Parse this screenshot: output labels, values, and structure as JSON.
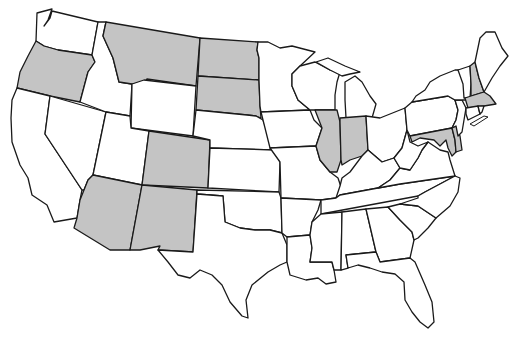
{
  "map": {
    "title": "United States map with highlighted states",
    "colors": {
      "shaded": "#c4c4c4",
      "unshaded": "#ffffff",
      "border": "#1a1a1a"
    },
    "shaded_states": [
      "Oregon",
      "Montana",
      "North Dakota",
      "South Dakota",
      "Colorado",
      "Arizona",
      "New Mexico",
      "Illinois",
      "Indiana",
      "New Hampshire",
      "Massachusetts",
      "Maryland",
      "Delaware"
    ],
    "states": [
      {
        "id": "WA",
        "name": "Washington",
        "shaded": false,
        "path": "M37,13 L52,9 L48,20 L44,26 L50,18 L52,11 L98,22 L92,55 L58,50 L44,46 L36,41 Z"
      },
      {
        "id": "OR",
        "name": "Oregon",
        "shaded": true,
        "path": "M36,41 L44,46 L58,50 L92,55 L95,62 L88,72 L80,102 L50,96 L17,88 L20,72 L28,56 Z"
      },
      {
        "id": "CA",
        "name": "California",
        "shaded": false,
        "path": "M17,88 L50,96 L45,134 L82,190 L80,200 L77,218 L54,222 L47,205 L32,195 L28,178 L20,165 L12,142 L11,118 L12,100 Z"
      },
      {
        "id": "NV",
        "name": "Nevada",
        "shaded": false,
        "path": "M50,96 L106,112 L93,175 L88,180 L84,190 L82,190 L45,134 Z"
      },
      {
        "id": "ID",
        "name": "Idaho",
        "shaded": false,
        "path": "M98,22 L106,22 L103,36 L113,58 L119,82 L132,84 L130,116 L106,112 L80,102 L88,72 L95,62 L92,55 Z"
      },
      {
        "id": "MT",
        "name": "Montana",
        "shaded": true,
        "path": "M106,22 L200,38 L196,86 L147,79 L144,83 L132,84 L119,82 L113,58 L103,36 Z"
      },
      {
        "id": "WY",
        "name": "Wyoming",
        "shaded": false,
        "path": "M144,80 L196,86 L193,136 L131,128 L132,84 Z"
      },
      {
        "id": "UT",
        "name": "Utah",
        "shaded": false,
        "path": "M106,112 L130,116 L131,128 L149,131 L142,185 L93,175 Z"
      },
      {
        "id": "AZ",
        "name": "Arizona",
        "shaded": true,
        "path": "M93,175 L142,185 L130,250 L110,250 L74,228 L77,218 L80,200 L84,190 L88,180 Z"
      },
      {
        "id": "CO",
        "name": "Colorado",
        "shaded": true,
        "path": "M149,131 L210,140 L208,188 L142,185 Z"
      },
      {
        "id": "NM",
        "name": "New Mexico",
        "shaded": true,
        "path": "M142,185 L197,190 L193,252 L158,250 L160,246 L140,250 L130,250 Z"
      },
      {
        "id": "ND",
        "name": "North Dakota",
        "shaded": true,
        "path": "M200,38 L258,42 L257,50 L259,58 L259,80 L198,76 Z"
      },
      {
        "id": "SD",
        "name": "South Dakota",
        "shaded": true,
        "path": "M198,76 L259,80 L260,106 L261,118 L256,116 L247,115 L196,110 Z"
      },
      {
        "id": "NE",
        "name": "Nebraska",
        "shaded": false,
        "path": "M196,110 L247,115 L256,116 L263,120 L274,150 L210,148 L210,140 L193,136 Z"
      },
      {
        "id": "KS",
        "name": "Kansas",
        "shaded": false,
        "path": "M210,148 L274,150 L280,162 L279,192 L208,188 Z"
      },
      {
        "id": "OK",
        "name": "Oklahoma",
        "shaded": false,
        "path": "M197,190 L279,192 L281,198 L282,233 L270,230 L255,230 L240,228 L225,222 L223,196 L197,194 Z"
      },
      {
        "id": "TX",
        "name": "Texas",
        "shaded": false,
        "path": "M197,194 L223,196 L225,222 L240,228 L255,230 L270,230 L282,233 L287,245 L287,262 L280,265 L268,272 L252,285 L246,300 L248,318 L242,316 L230,302 L222,285 L212,275 L200,270 L190,278 L178,275 L168,262 L158,250 L193,252 Z"
      },
      {
        "id": "MN",
        "name": "Minnesota",
        "shaded": false,
        "path": "M258,42 L268,42 L280,48 L292,46 L315,52 L300,66 L292,74 L292,86 L298,100 L310,110 L261,112 L260,106 L259,80 L259,58 L257,50 Z"
      },
      {
        "id": "IA",
        "name": "Iowa",
        "shaded": false,
        "path": "M261,112 L310,110 L314,120 L322,128 L318,140 L316,146 L270,148 L263,120 Z"
      },
      {
        "id": "MO",
        "name": "Missouri",
        "shaded": false,
        "path": "M270,148 L316,146 L320,160 L330,172 L338,178 L342,190 L336,198 L321,200 L281,198 L280,162 Z"
      },
      {
        "id": "AR",
        "name": "Arkansas",
        "shaded": false,
        "path": "M281,198 L321,200 L318,210 L312,222 L310,235 L287,237 L282,233 Z"
      },
      {
        "id": "LA",
        "name": "Louisiana",
        "shaded": false,
        "path": "M287,237 L310,235 L312,248 L310,262 L332,262 L334,270 L336,282 L326,284 L318,278 L306,280 L290,275 L287,262 Z"
      },
      {
        "id": "WI",
        "name": "Wisconsin",
        "shaded": false,
        "path": "M292,74 L300,66 L315,62 L330,70 L340,72 L337,82 L335,95 L335,110 L315,110 L310,110 L298,100 L292,86 Z"
      },
      {
        "id": "IL",
        "name": "Illinois",
        "shaded": true,
        "path": "M315,110 L337,110 L340,122 L341,160 L337,172 L330,172 L320,160 L316,146 L318,140 L322,128 Z"
      },
      {
        "id": "MI",
        "name": "Michigan",
        "shaded": false,
        "path": "M316,62 L328,58 L345,66 L360,72 L350,74 L342,76 L330,70 Z M345,82 L355,76 L362,82 L370,96 L376,104 L372,118 L360,118 L346,118 L345,100 Z"
      },
      {
        "id": "IN",
        "name": "Indiana",
        "shaded": true,
        "path": "M340,118 L366,116 L368,150 L362,156 L350,160 L342,165 L341,160 L340,122 Z"
      },
      {
        "id": "OH",
        "name": "Ohio",
        "shaded": false,
        "path": "M366,116 L380,118 L395,112 L405,108 L407,130 L402,148 L394,158 L382,162 L368,150 Z"
      },
      {
        "id": "KY",
        "name": "Kentucky",
        "shaded": false,
        "path": "M336,198 L340,186 L342,178 L350,172 L362,156 L368,150 L382,162 L394,158 L400,168 L390,180 L378,188 L340,195 Z"
      },
      {
        "id": "TN",
        "name": "Tennessee",
        "shaded": false,
        "path": "M336,198 L340,195 L378,188 L400,184 L455,176 L440,184 L425,192 L418,196 L321,214 L321,200 Z"
      },
      {
        "id": "MS",
        "name": "Mississippi",
        "shaded": false,
        "path": "M321,214 L342,212 L341,270 L334,270 L332,262 L310,262 L312,248 L310,235 L312,222 Z"
      },
      {
        "id": "AL",
        "name": "Alabama",
        "shaded": false,
        "path": "M342,212 L366,209 L376,252 L346,255 L348,268 L341,270 Z"
      },
      {
        "id": "GA",
        "name": "Georgia",
        "shaded": false,
        "path": "M366,209 L388,207 L400,220 L412,232 L414,240 L410,258 L380,262 L376,252 Z"
      },
      {
        "id": "FL",
        "name": "Florida",
        "shaded": false,
        "path": "M346,255 L376,252 L380,262 L410,258 L415,262 L425,285 L432,302 L434,322 L428,328 L420,322 L412,312 L405,300 L404,282 L395,274 L382,272 L370,268 L358,265 L348,268 Z"
      },
      {
        "id": "SC",
        "name": "South Carolina",
        "shaded": false,
        "path": "M388,207 L400,204 L418,206 L436,218 L428,228 L418,238 L414,240 L412,232 L400,220 Z"
      },
      {
        "id": "NC",
        "name": "North Carolina",
        "shaded": false,
        "path": "M418,196 L425,192 L440,184 L455,176 L460,178 L458,192 L450,206 L436,218 L418,206 L400,204 L418,198 Z"
      },
      {
        "id": "VA",
        "name": "Virginia",
        "shaded": false,
        "path": "M378,188 L390,180 L400,168 L410,170 L418,158 L422,150 L428,142 L440,150 L448,152 L450,160 L455,176 L400,184 Z"
      },
      {
        "id": "WV",
        "name": "West Virginia",
        "shaded": false,
        "path": "M394,158 L402,148 L407,130 L410,142 L418,146 L428,142 L422,150 L418,158 L410,170 L400,168 Z"
      },
      {
        "id": "PA",
        "name": "Pennsylvania",
        "shaded": false,
        "path": "M405,108 L412,102 L448,96 L455,100 L458,110 L456,120 L452,128 L410,136 L407,130 Z"
      },
      {
        "id": "MD",
        "name": "Maryland",
        "shaded": true,
        "path": "M410,136 L452,128 L455,140 L456,152 L452,156 L448,148 L446,140 L440,146 L434,140 L420,138 L412,142 Z"
      },
      {
        "id": "DE",
        "name": "Delaware",
        "shaded": true,
        "path": "M452,128 L456,126 L460,136 L462,150 L456,152 L455,140 Z"
      },
      {
        "id": "NJ",
        "name": "New Jersey",
        "shaded": false,
        "path": "M455,100 L462,100 L466,108 L464,120 L462,132 L458,136 L456,126 L452,128 L456,120 L458,110 Z"
      },
      {
        "id": "NY",
        "name": "New York",
        "shaded": false,
        "path": "M412,102 L416,96 L425,90 L430,82 L440,76 L455,70 L460,70 L464,84 L466,100 L462,100 L455,100 L448,96 Z"
      },
      {
        "id": "VT",
        "name": "Vermont",
        "shaded": false,
        "path": "M458,70 L470,66 L471,84 L470,98 L464,98 L463,84 Z"
      },
      {
        "id": "NH",
        "name": "New Hampshire",
        "shaded": true,
        "path": "M470,66 L475,62 L479,78 L484,92 L471,96 L471,84 Z"
      },
      {
        "id": "ME",
        "name": "Maine",
        "shaded": false,
        "path": "M475,62 L480,38 L486,32 L495,32 L502,48 L508,56 L500,66 L492,78 L484,92 L479,78 Z"
      },
      {
        "id": "MA",
        "name": "Massachusetts",
        "shaded": true,
        "path": "M465,98 L471,96 L484,92 L490,96 L493,100 L496,104 L484,106 L468,108 Z"
      },
      {
        "id": "CT",
        "name": "Connecticut",
        "shaded": false,
        "path": "M466,108 L478,106 L480,114 L468,120 L466,114 Z"
      },
      {
        "id": "RI",
        "name": "Rhode Island",
        "shaded": false,
        "path": "M478,106 L484,106 L482,112 L480,114 Z"
      }
    ],
    "features": {
      "long_island": "M470,124 L484,116 L488,117 L474,126 Z"
    }
  }
}
